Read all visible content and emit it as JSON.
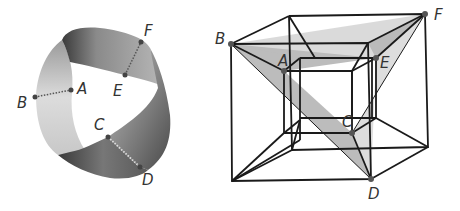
{
  "figures": {
    "left": {
      "name": "twisted band",
      "labels": {
        "A": "A",
        "B": "B",
        "C": "C",
        "D": "D",
        "E": "E",
        "F": "F"
      }
    },
    "right": {
      "name": "hypercube projection",
      "labels": {
        "A": "A",
        "B": "B",
        "C": "C",
        "D": "D",
        "E": "E",
        "F": "F"
      }
    }
  },
  "colors": {
    "line": "#1a1a1a",
    "point": "#555555",
    "label": "#333333",
    "shade_dark": "#999999",
    "shade_light": "#cfcfcf"
  }
}
